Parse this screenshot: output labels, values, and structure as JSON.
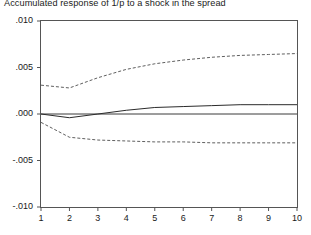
{
  "chart_data": {
    "type": "line",
    "title": "Accumulated response of 1/p to a shock in the spread",
    "xlabel": "",
    "ylabel": "",
    "x": [
      1,
      2,
      3,
      4,
      5,
      6,
      7,
      8,
      9,
      10
    ],
    "xlim": [
      1,
      10
    ],
    "ylim": [
      -0.01,
      0.01
    ],
    "xticks": [
      "1",
      "2",
      "3",
      "4",
      "5",
      "6",
      "7",
      "8",
      "9",
      "10"
    ],
    "yticks": [
      ".010",
      ".005",
      ".000",
      "-.005",
      "-.010"
    ],
    "ytick_values": [
      0.01,
      0.005,
      0.0,
      -0.005,
      -0.01
    ],
    "grid": false,
    "legend": "none",
    "zero_line": 0.0,
    "series": [
      {
        "name": "upper confidence band",
        "style": "dashed",
        "color": "#4d4d4d",
        "values": [
          0.0031,
          0.0028,
          0.0039,
          0.0048,
          0.0054,
          0.0058,
          0.0061,
          0.0063,
          0.0064,
          0.0065
        ]
      },
      {
        "name": "accumulated response",
        "style": "solid",
        "color": "#2b2b2b",
        "values": [
          0.0,
          -0.0004,
          0.0,
          0.0004,
          0.0007,
          0.0008,
          0.0009,
          0.001,
          0.001,
          0.001
        ]
      },
      {
        "name": "lower confidence band",
        "style": "dashed",
        "color": "#4d4d4d",
        "values": [
          -0.0009,
          -0.0025,
          -0.0028,
          -0.0029,
          -0.003,
          -0.003,
          -0.0031,
          -0.0031,
          -0.0031,
          -0.0031
        ]
      }
    ]
  },
  "axes": {
    "frame_color": "#555555",
    "zero_line_color": "#3a3a3a"
  }
}
